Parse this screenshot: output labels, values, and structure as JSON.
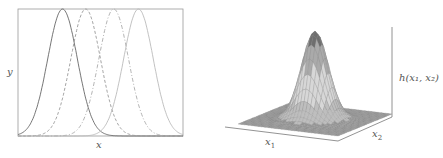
{
  "chart_data": [
    {
      "type": "line",
      "title": "",
      "xlabel": "x",
      "ylabel": "y",
      "grid": false,
      "legend": null,
      "series": [
        {
          "name": "curve-1",
          "mean": 0.27,
          "sd": 0.09,
          "style": "solid",
          "color": "#666666"
        },
        {
          "name": "curve-2",
          "mean": 0.41,
          "sd": 0.09,
          "style": "dashed",
          "color": "#999999"
        },
        {
          "name": "curve-3",
          "mean": 0.58,
          "sd": 0.09,
          "style": "dashdot",
          "color": "#aaaaaa"
        },
        {
          "name": "curve-4",
          "mean": 0.73,
          "sd": 0.09,
          "style": "solid-light",
          "color": "#bbbbbb"
        }
      ],
      "xlim": [
        0,
        1
      ],
      "ylim": [
        0,
        1
      ]
    },
    {
      "type": "surface",
      "title": "",
      "xlabel": "x_1",
      "ylabel": "x_2",
      "zlabel": "h(x_1, x_2)",
      "description": "3D Gaussian bump surface, peak centered, gray shaded mesh"
    }
  ],
  "labels": {
    "left_x": "x",
    "left_y": "y",
    "right_x1": "x",
    "right_x1_sub": "1",
    "right_x2": "x",
    "right_x2_sub": "2",
    "right_z": "h(x₁, x₂)"
  }
}
